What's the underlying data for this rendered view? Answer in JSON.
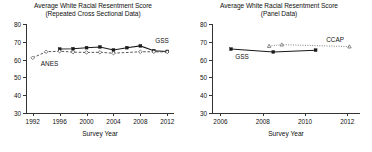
{
  "figure": {
    "xlabel": "Survey Year",
    "panels": [
      {
        "id": "repeated-cross-sectional",
        "title_line1": "Average White Racial Resentment Score",
        "title_line2": "(Repeated Cross Sectional Data)",
        "xlabel": "Survey Year",
        "ylim": [
          30,
          80
        ],
        "yticks": [
          30,
          40,
          50,
          60,
          70,
          80
        ],
        "xlim": [
          1991,
          2013
        ],
        "xticks": [
          1992,
          1996,
          2000,
          2004,
          2008,
          2012
        ],
        "annotations": [
          {
            "text": "GSS",
            "x": 2010.2,
            "y": 70.5
          },
          {
            "text": "ANES",
            "x": 1993.2,
            "y": 57.6
          }
        ]
      },
      {
        "id": "panel-data",
        "title_line1": "Average White Racial Resentment Score",
        "title_line2": "(Panel Data)",
        "xlabel": "Survey Year",
        "ylim": [
          30,
          80
        ],
        "yticks": [
          30,
          40,
          50,
          60,
          70,
          80
        ],
        "xlim": [
          2005.6,
          2012.6
        ],
        "xticks": [
          2006,
          2008,
          2010,
          2012
        ],
        "annotations": [
          {
            "text": "CCAP",
            "x": 2011.0,
            "y": 71.0
          },
          {
            "text": "GSS",
            "x": 2006.7,
            "y": 61.5
          }
        ]
      }
    ]
  },
  "chart_data": [
    {
      "type": "line",
      "title": "Average White Racial Resentment Score (Repeated Cross Sectional Data)",
      "xlabel": "Survey Year",
      "ylabel": "",
      "xlim": [
        1991,
        2013
      ],
      "ylim": [
        30,
        80
      ],
      "xticks": [
        1992,
        1996,
        2000,
        2004,
        2008,
        2012
      ],
      "yticks": [
        30,
        40,
        50,
        60,
        70,
        80
      ],
      "grid": false,
      "legend": "inline-annotations",
      "series": [
        {
          "name": "GSS",
          "style": "solid",
          "marker": "filled-square",
          "color": "#1a1a1a",
          "points": [
            {
              "x": 1996,
              "y": 65.9
            },
            {
              "x": 1998,
              "y": 66.1
            },
            {
              "x": 2000,
              "y": 66.7
            },
            {
              "x": 2002,
              "y": 67.1
            },
            {
              "x": 2004,
              "y": 65.4
            },
            {
              "x": 2006,
              "y": 66.7
            },
            {
              "x": 2008,
              "y": 67.7
            },
            {
              "x": 2010,
              "y": 65.0
            },
            {
              "x": 2012,
              "y": 64.6
            }
          ]
        },
        {
          "name": "ANES",
          "style": "dashed",
          "marker": "open-diamond",
          "color": "#3a3a3a",
          "points": [
            {
              "x": 1992,
              "y": 61.0
            },
            {
              "x": 1994,
              "y": 64.4
            },
            {
              "x": 1996,
              "y": 64.7
            },
            {
              "x": 1998,
              "y": 64.2
            },
            {
              "x": 2000,
              "y": 64.0
            },
            {
              "x": 2002,
              "y": 64.1
            },
            {
              "x": 2004,
              "y": 63.6
            },
            {
              "x": 2008,
              "y": 64.4
            },
            {
              "x": 2010,
              "y": 64.4
            },
            {
              "x": 2012,
              "y": 64.3
            }
          ]
        }
      ]
    },
    {
      "type": "line",
      "title": "Average White Racial Resentment Score (Panel Data)",
      "xlabel": "Survey Year",
      "ylabel": "",
      "xlim": [
        2005.6,
        2012.6
      ],
      "ylim": [
        30,
        80
      ],
      "xticks": [
        2006,
        2008,
        2010,
        2012
      ],
      "yticks": [
        30,
        40,
        50,
        60,
        70,
        80
      ],
      "grid": false,
      "legend": "inline-annotations",
      "series": [
        {
          "name": "GSS",
          "style": "solid",
          "marker": "filled-square",
          "color": "#1a1a1a",
          "points": [
            {
              "x": 2006.5,
              "y": 65.9
            },
            {
              "x": 2008.5,
              "y": 64.3
            },
            {
              "x": 2010.5,
              "y": 65.3
            }
          ]
        },
        {
          "name": "CCAP",
          "style": "dotted",
          "marker": "open-triangle",
          "color": "#5a5a5a",
          "points": [
            {
              "x": 2008.3,
              "y": 67.6
            },
            {
              "x": 2008.9,
              "y": 68.4
            },
            {
              "x": 2012.1,
              "y": 67.3
            }
          ]
        }
      ]
    }
  ]
}
